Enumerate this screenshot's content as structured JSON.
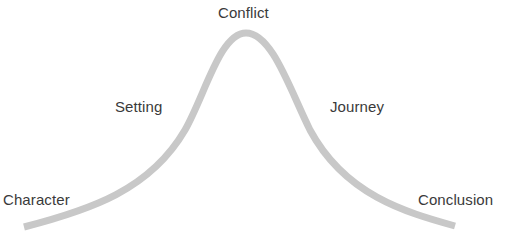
{
  "diagram": {
    "type": "story-arc-bell-curve",
    "curve_color": "#c8c8c8",
    "text_color": "#3a3a3a",
    "labels": {
      "peak": "Conflict",
      "rising": "Setting",
      "falling": "Journey",
      "start": "Character",
      "end": "Conclusion"
    },
    "sequence": [
      "Character",
      "Setting",
      "Conflict",
      "Journey",
      "Conclusion"
    ]
  }
}
